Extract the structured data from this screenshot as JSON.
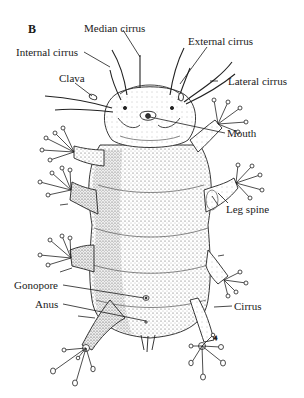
{
  "figure": {
    "panel_letter": "B"
  },
  "labels": {
    "median_cirrus": "Median cirrus",
    "internal_cirrus": "Internal cirrus",
    "external_cirrus": "External cirrus",
    "lateral_cirrus": "Lateral cirrus",
    "clava": "Clava",
    "mouth": "Mouth",
    "leg_spine": "Leg spine",
    "gonopore": "Gonopore",
    "anus": "Anus",
    "cirrus": "Cirrus"
  },
  "colors": {
    "background": "#ffffff",
    "ink": "#1a1a1a",
    "stipple": "#6e6e6e"
  }
}
